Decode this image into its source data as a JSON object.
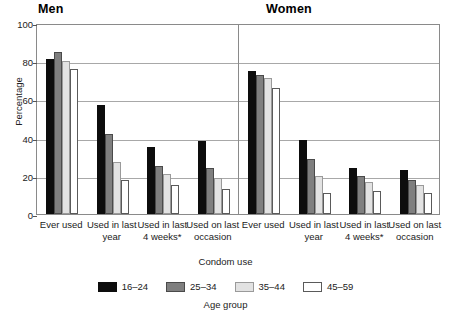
{
  "chart_data": {
    "type": "bar",
    "title": "",
    "panels": [
      {
        "label": "Men",
        "categories": [
          "Ever used",
          "Used in last year",
          "Used in last 4 weeks*",
          "Used on last occasion"
        ],
        "series": [
          {
            "name": "16–24",
            "color": "#0d0d0d",
            "values": [
              81,
              57,
              35,
              38
            ]
          },
          {
            "name": "25–34",
            "color": "#7f7f7f",
            "values": [
              85,
              42,
              25,
              24
            ]
          },
          {
            "name": "35–44",
            "color": "#e2e2e2",
            "values": [
              80,
              27,
              21,
              19
            ]
          },
          {
            "name": "45–59",
            "color": "#ffffff",
            "values": [
              76,
              18,
              15,
              13
            ]
          }
        ]
      },
      {
        "label": "Women",
        "categories": [
          "Ever used",
          "Used in last year",
          "Used in last 4 weeks*",
          "Used on last occasion"
        ],
        "series": [
          {
            "name": "16–24",
            "color": "#0d0d0d",
            "values": [
              75,
              39,
              24,
              23
            ]
          },
          {
            "name": "25–34",
            "color": "#7f7f7f",
            "values": [
              73,
              29,
              20,
              18
            ]
          },
          {
            "name": "35–44",
            "color": "#e2e2e2",
            "values": [
              71,
              20,
              17,
              15
            ]
          },
          {
            "name": "45–59",
            "color": "#ffffff",
            "values": [
              66,
              11,
              12,
              11
            ]
          }
        ]
      }
    ],
    "xlabel": "Condom use",
    "ylabel": "Percentage",
    "ylim": [
      0,
      100
    ],
    "yticks": [
      0,
      20,
      40,
      60,
      80,
      100
    ],
    "grid": true,
    "legend": {
      "title": "Age group",
      "position": "bottom",
      "entries": [
        "16–24",
        "25–34",
        "35–44",
        "45–59"
      ]
    }
  },
  "axis": {
    "ylabel": "Percentage",
    "xlabel": "Condom use",
    "ytick_labels": [
      "100",
      "80",
      "60",
      "40",
      "20",
      "0"
    ]
  },
  "panels": {
    "men_title": "Men",
    "women_title": "Women"
  },
  "xtick_labels": [
    "Ever used",
    "Used in last year",
    "Used in last 4 weeks*",
    "Used on last occasion"
  ],
  "legend": {
    "title": "Age group",
    "items": [
      {
        "label": "16–24"
      },
      {
        "label": "25–34"
      },
      {
        "label": "35–44"
      },
      {
        "label": "45–59"
      }
    ]
  }
}
